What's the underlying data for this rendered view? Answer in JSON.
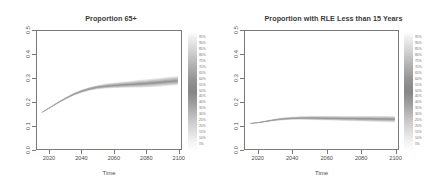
{
  "chart_data": [
    {
      "type": "line",
      "title": "Proportion 65+",
      "xlabel": "Time",
      "ylabel": "",
      "xlim": [
        2012,
        2102
      ],
      "ylim": [
        0.0,
        0.5
      ],
      "xticks": [
        "2020",
        "2040",
        "2060",
        "2080",
        "2100"
      ],
      "xtick_values": [
        2020,
        2040,
        2060,
        2080,
        2100
      ],
      "yticks": [
        "0.0",
        "0.1",
        "0.2",
        "0.3",
        "0.4",
        "0.5"
      ],
      "ytick_values": [
        0.0,
        0.1,
        0.2,
        0.3,
        0.4,
        0.5
      ],
      "grid": false,
      "legend_position": "right",
      "legend_title": "",
      "legend_entries": [
        "95%",
        "90%",
        "85%",
        "80%",
        "75%",
        "70%",
        "65%",
        "60%",
        "55%",
        "50%",
        "45%",
        "40%",
        "35%",
        "30%",
        "25%",
        "20%",
        "15%",
        "10%",
        "5%"
      ],
      "x": [
        2015,
        2020,
        2025,
        2030,
        2035,
        2040,
        2045,
        2050,
        2055,
        2060,
        2065,
        2070,
        2075,
        2080,
        2085,
        2090,
        2095,
        2100
      ],
      "series": [
        {
          "name": "median",
          "values": [
            0.155,
            0.175,
            0.196,
            0.215,
            0.232,
            0.245,
            0.255,
            0.262,
            0.266,
            0.269,
            0.271,
            0.273,
            0.275,
            0.277,
            0.28,
            0.283,
            0.286,
            0.289
          ]
        },
        {
          "name": "upper",
          "values": [
            0.155,
            0.176,
            0.198,
            0.218,
            0.236,
            0.25,
            0.261,
            0.269,
            0.275,
            0.279,
            0.283,
            0.286,
            0.29,
            0.293,
            0.297,
            0.3,
            0.304,
            0.307
          ]
        },
        {
          "name": "lower",
          "values": [
            0.155,
            0.174,
            0.194,
            0.212,
            0.228,
            0.24,
            0.249,
            0.255,
            0.258,
            0.26,
            0.261,
            0.262,
            0.262,
            0.263,
            0.265,
            0.267,
            0.27,
            0.272
          ]
        }
      ]
    },
    {
      "type": "line",
      "title": "Proportion with RLE Less than 15 Years",
      "xlabel": "Time",
      "ylabel": "",
      "xlim": [
        2012,
        2102
      ],
      "ylim": [
        0.0,
        0.5
      ],
      "xticks": [
        "2020",
        "2040",
        "2060",
        "2080",
        "2100"
      ],
      "xtick_values": [
        2020,
        2040,
        2060,
        2080,
        2100
      ],
      "yticks": [
        "0.0",
        "0.1",
        "0.2",
        "0.3",
        "0.4",
        "0.5"
      ],
      "ytick_values": [
        0.0,
        0.1,
        0.2,
        0.3,
        0.4,
        0.5
      ],
      "grid": false,
      "legend_position": "right",
      "legend_title": "",
      "legend_entries": [
        "95%",
        "90%",
        "85%",
        "80%",
        "75%",
        "70%",
        "65%",
        "60%",
        "55%",
        "50%",
        "45%",
        "40%",
        "35%",
        "30%",
        "25%",
        "20%",
        "15%",
        "10%",
        "5%"
      ],
      "x": [
        2015,
        2020,
        2025,
        2030,
        2035,
        2040,
        2045,
        2050,
        2055,
        2060,
        2065,
        2070,
        2075,
        2080,
        2085,
        2090,
        2095,
        2100
      ],
      "series": [
        {
          "name": "median",
          "values": [
            0.108,
            0.112,
            0.118,
            0.124,
            0.128,
            0.13,
            0.131,
            0.131,
            0.131,
            0.13,
            0.13,
            0.129,
            0.129,
            0.128,
            0.128,
            0.127,
            0.127,
            0.126
          ]
        },
        {
          "name": "upper",
          "values": [
            0.108,
            0.113,
            0.12,
            0.127,
            0.132,
            0.135,
            0.137,
            0.138,
            0.138,
            0.138,
            0.138,
            0.138,
            0.138,
            0.138,
            0.138,
            0.138,
            0.138,
            0.138
          ]
        },
        {
          "name": "lower",
          "values": [
            0.108,
            0.111,
            0.116,
            0.121,
            0.124,
            0.126,
            0.126,
            0.125,
            0.124,
            0.123,
            0.122,
            0.121,
            0.12,
            0.119,
            0.118,
            0.117,
            0.116,
            0.115
          ]
        }
      ]
    }
  ],
  "panels": [
    {
      "title": "Proportion 65+",
      "axis_title": "Time",
      "yticks": [
        "0.0",
        "0.1",
        "0.2",
        "0.3",
        "0.4",
        "0.5"
      ],
      "xticks": [
        "2020",
        "2040",
        "2060",
        "2080",
        "2100"
      ]
    },
    {
      "title": "Proportion with RLE Less than 15 Years",
      "axis_title": "Time",
      "yticks": [
        "0.0",
        "0.1",
        "0.2",
        "0.3",
        "0.4",
        "0.5"
      ],
      "xticks": [
        "2020",
        "2040",
        "2060",
        "2080",
        "2100"
      ]
    }
  ],
  "colors": {
    "frame": "#7a7a7a",
    "text": "#4a4a4a",
    "title": "#3a3a3a",
    "fan": "#8a8a8a"
  }
}
